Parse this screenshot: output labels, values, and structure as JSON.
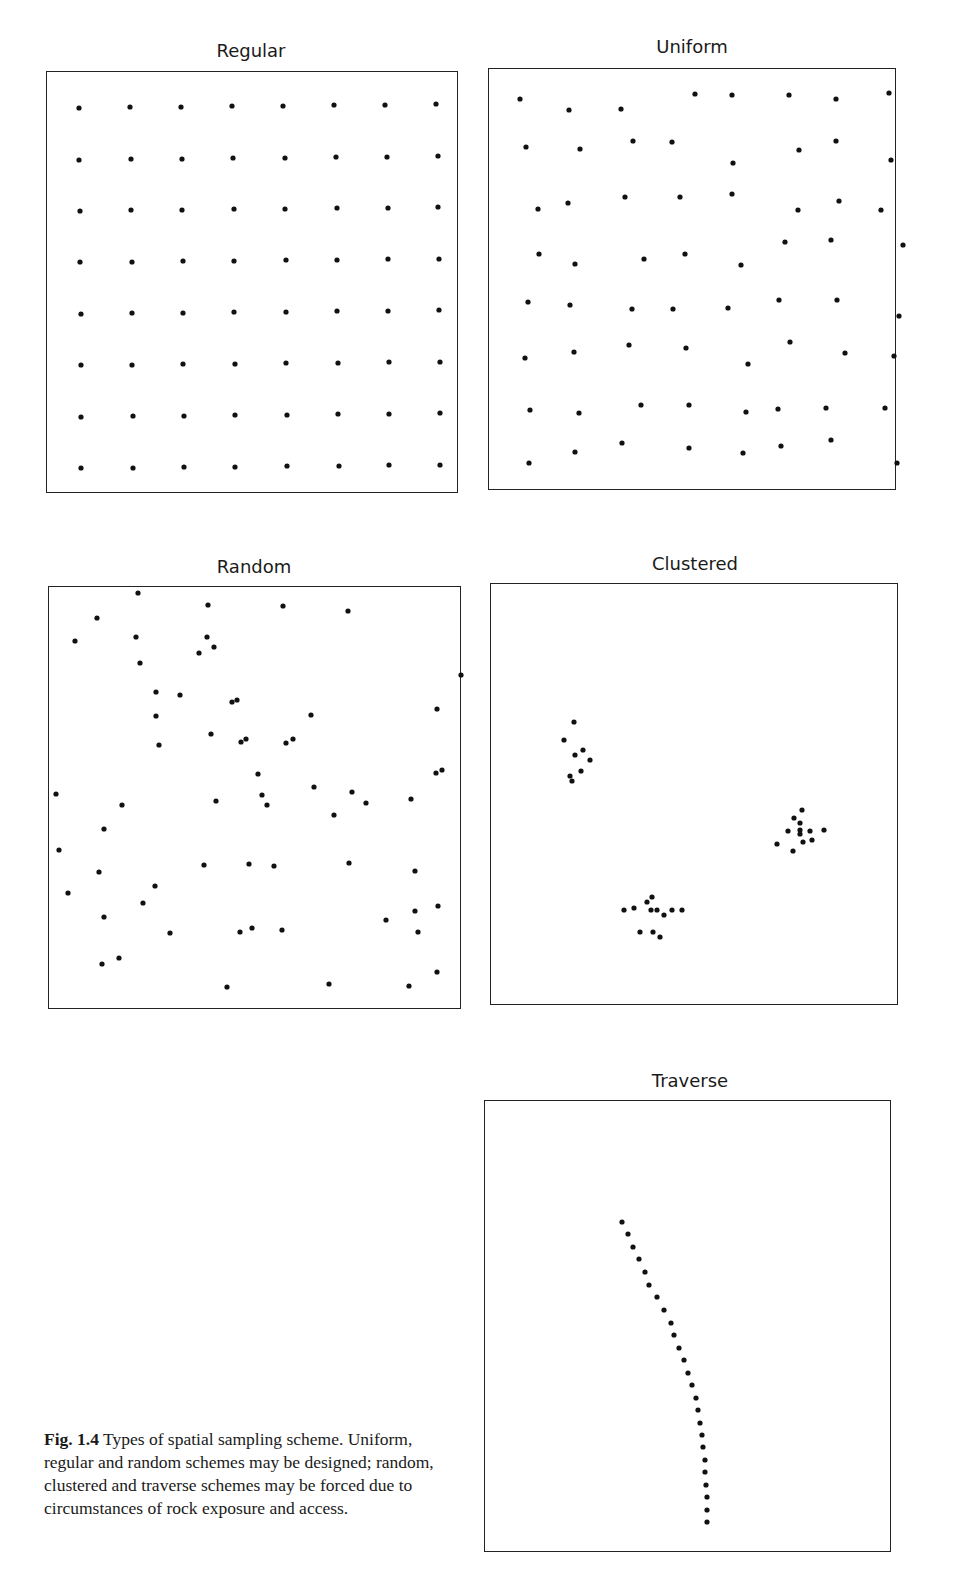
{
  "figure": {
    "label": "Fig. 1.4",
    "caption_text": "Types of spatial sampling scheme. Uniform, regular and random schemes may be designed; random, clustered and traverse schemes may be forced due to circumstances of rock exposure and access.",
    "dot_color": "#111111",
    "border_color": "#222222"
  },
  "panels": [
    {
      "id": "regular",
      "title": "Regular",
      "title_pos": [
        251,
        40
      ],
      "box": [
        46,
        71,
        412,
        422
      ],
      "points": [
        [
          79,
          108
        ],
        [
          130,
          107
        ],
        [
          181,
          107
        ],
        [
          232,
          106
        ],
        [
          283,
          106
        ],
        [
          334,
          105
        ],
        [
          385,
          105
        ],
        [
          436,
          104
        ],
        [
          79,
          160
        ],
        [
          131,
          159
        ],
        [
          182,
          159
        ],
        [
          233,
          158
        ],
        [
          285,
          158
        ],
        [
          336,
          157
        ],
        [
          387,
          157
        ],
        [
          438,
          156
        ],
        [
          80,
          211
        ],
        [
          131,
          210
        ],
        [
          182,
          210
        ],
        [
          234,
          209
        ],
        [
          285,
          209
        ],
        [
          337,
          208
        ],
        [
          388,
          208
        ],
        [
          438,
          207
        ],
        [
          80,
          262
        ],
        [
          132,
          262
        ],
        [
          183,
          261
        ],
        [
          234,
          261
        ],
        [
          286,
          260
        ],
        [
          337,
          260
        ],
        [
          388,
          259
        ],
        [
          439,
          259
        ],
        [
          81,
          314
        ],
        [
          132,
          313
        ],
        [
          183,
          313
        ],
        [
          234,
          312
        ],
        [
          286,
          312
        ],
        [
          337,
          311
        ],
        [
          388,
          311
        ],
        [
          439,
          310
        ],
        [
          81,
          365
        ],
        [
          132,
          365
        ],
        [
          183,
          364
        ],
        [
          235,
          364
        ],
        [
          286,
          363
        ],
        [
          338,
          363
        ],
        [
          389,
          362
        ],
        [
          440,
          362
        ],
        [
          81,
          417
        ],
        [
          133,
          416
        ],
        [
          184,
          416
        ],
        [
          235,
          415
        ],
        [
          287,
          415
        ],
        [
          338,
          414
        ],
        [
          389,
          414
        ],
        [
          440,
          413
        ],
        [
          81,
          468
        ],
        [
          133,
          468
        ],
        [
          184,
          467
        ],
        [
          235,
          467
        ],
        [
          287,
          466
        ],
        [
          339,
          466
        ],
        [
          389,
          465
        ],
        [
          440,
          465
        ]
      ]
    },
    {
      "id": "uniform",
      "title": "Uniform",
      "title_pos": [
        692,
        36
      ],
      "box": [
        488,
        68,
        408,
        422
      ],
      "points": [
        [
          520,
          99
        ],
        [
          569,
          110
        ],
        [
          621,
          109
        ],
        [
          695,
          94
        ],
        [
          732,
          95
        ],
        [
          789,
          95
        ],
        [
          836,
          99
        ],
        [
          889,
          93
        ],
        [
          526,
          147
        ],
        [
          580,
          149
        ],
        [
          633,
          141
        ],
        [
          672,
          142
        ],
        [
          733,
          163
        ],
        [
          799,
          150
        ],
        [
          836,
          141
        ],
        [
          891,
          160
        ],
        [
          538,
          209
        ],
        [
          568,
          203
        ],
        [
          625,
          197
        ],
        [
          680,
          197
        ],
        [
          732,
          194
        ],
        [
          798,
          210
        ],
        [
          839,
          201
        ],
        [
          881,
          210
        ],
        [
          539,
          254
        ],
        [
          575,
          264
        ],
        [
          644,
          259
        ],
        [
          685,
          254
        ],
        [
          741,
          265
        ],
        [
          785,
          242
        ],
        [
          831,
          240
        ],
        [
          903,
          245
        ],
        [
          528,
          302
        ],
        [
          570,
          305
        ],
        [
          632,
          309
        ],
        [
          673,
          309
        ],
        [
          728,
          308
        ],
        [
          779,
          300
        ],
        [
          837,
          300
        ],
        [
          899,
          316
        ],
        [
          525,
          358
        ],
        [
          574,
          352
        ],
        [
          629,
          345
        ],
        [
          686,
          348
        ],
        [
          748,
          364
        ],
        [
          790,
          342
        ],
        [
          845,
          353
        ],
        [
          894,
          356
        ],
        [
          530,
          410
        ],
        [
          579,
          413
        ],
        [
          641,
          405
        ],
        [
          689,
          405
        ],
        [
          746,
          412
        ],
        [
          778,
          409
        ],
        [
          826,
          408
        ],
        [
          885,
          408
        ],
        [
          529,
          463
        ],
        [
          575,
          452
        ],
        [
          622,
          443
        ],
        [
          689,
          448
        ],
        [
          743,
          453
        ],
        [
          781,
          446
        ],
        [
          831,
          440
        ],
        [
          897,
          463
        ]
      ]
    },
    {
      "id": "random",
      "title": "Random",
      "title_pos": [
        254,
        556
      ],
      "box": [
        48,
        586,
        413,
        423
      ],
      "points": [
        [
          138,
          593
        ],
        [
          208,
          605
        ],
        [
          97,
          618
        ],
        [
          283,
          606
        ],
        [
          348,
          611
        ],
        [
          75,
          641
        ],
        [
          136,
          637
        ],
        [
          207,
          637
        ],
        [
          214,
          647
        ],
        [
          199,
          653
        ],
        [
          140,
          663
        ],
        [
          156,
          692
        ],
        [
          180,
          695
        ],
        [
          232,
          702
        ],
        [
          237,
          700
        ],
        [
          156,
          716
        ],
        [
          461,
          675
        ],
        [
          437,
          709
        ],
        [
          311,
          715
        ],
        [
          211,
          734
        ],
        [
          241,
          742
        ],
        [
          246,
          739
        ],
        [
          286,
          743
        ],
        [
          293,
          739
        ],
        [
          159,
          745
        ],
        [
          258,
          774
        ],
        [
          436,
          773
        ],
        [
          442,
          770
        ],
        [
          56,
          794
        ],
        [
          262,
          795
        ],
        [
          216,
          801
        ],
        [
          267,
          805
        ],
        [
          314,
          787
        ],
        [
          352,
          792
        ],
        [
          366,
          803
        ],
        [
          411,
          799
        ],
        [
          122,
          805
        ],
        [
          104,
          829
        ],
        [
          334,
          815
        ],
        [
          59,
          850
        ],
        [
          99,
          872
        ],
        [
          204,
          865
        ],
        [
          249,
          864
        ],
        [
          274,
          866
        ],
        [
          349,
          863
        ],
        [
          415,
          871
        ],
        [
          68,
          893
        ],
        [
          155,
          886
        ],
        [
          143,
          903
        ],
        [
          104,
          917
        ],
        [
          170,
          933
        ],
        [
          240,
          932
        ],
        [
          252,
          928
        ],
        [
          282,
          930
        ],
        [
          386,
          920
        ],
        [
          415,
          911
        ],
        [
          438,
          906
        ],
        [
          418,
          932
        ],
        [
          102,
          964
        ],
        [
          119,
          958
        ],
        [
          227,
          987
        ],
        [
          329,
          984
        ],
        [
          409,
          986
        ],
        [
          437,
          972
        ]
      ]
    },
    {
      "id": "clustered",
      "title": "Clustered",
      "title_pos": [
        695,
        553
      ],
      "box": [
        490,
        583,
        408,
        422
      ],
      "points": [
        [
          574,
          722
        ],
        [
          564,
          740
        ],
        [
          575,
          755
        ],
        [
          583,
          750
        ],
        [
          590,
          760
        ],
        [
          581,
          771
        ],
        [
          570,
          776
        ],
        [
          572,
          781
        ],
        [
          802,
          810
        ],
        [
          794,
          818
        ],
        [
          800,
          823
        ],
        [
          788,
          831
        ],
        [
          800,
          830
        ],
        [
          800,
          834
        ],
        [
          810,
          831
        ],
        [
          824,
          830
        ],
        [
          777,
          844
        ],
        [
          803,
          842
        ],
        [
          812,
          840
        ],
        [
          793,
          851
        ],
        [
          624,
          910
        ],
        [
          634,
          908
        ],
        [
          647,
          902
        ],
        [
          652,
          897
        ],
        [
          651,
          910
        ],
        [
          657,
          910
        ],
        [
          664,
          915
        ],
        [
          672,
          910
        ],
        [
          682,
          910
        ],
        [
          640,
          932
        ],
        [
          653,
          932
        ],
        [
          660,
          937
        ]
      ]
    },
    {
      "id": "traverse",
      "title": "Traverse",
      "title_pos": [
        690,
        1070
      ],
      "box": [
        484,
        1100,
        407,
        452
      ],
      "points": [
        [
          622,
          1222
        ],
        [
          628,
          1234
        ],
        [
          633,
          1247
        ],
        [
          639,
          1259
        ],
        [
          645,
          1272
        ],
        [
          649,
          1285
        ],
        [
          657,
          1297
        ],
        [
          664,
          1310
        ],
        [
          671,
          1323
        ],
        [
          674,
          1335
        ],
        [
          679,
          1348
        ],
        [
          684,
          1360
        ],
        [
          688,
          1373
        ],
        [
          692,
          1385
        ],
        [
          696,
          1398
        ],
        [
          698,
          1410
        ],
        [
          700,
          1423
        ],
        [
          702,
          1435
        ],
        [
          703,
          1447
        ],
        [
          705,
          1460
        ],
        [
          705,
          1472
        ],
        [
          706,
          1485
        ],
        [
          707,
          1497
        ],
        [
          707,
          1510
        ],
        [
          707,
          1522
        ]
      ]
    }
  ]
}
